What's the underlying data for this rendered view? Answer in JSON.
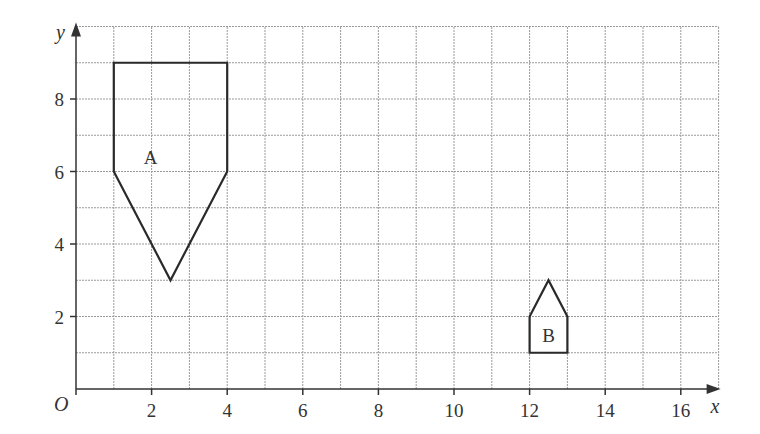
{
  "chart_data": {
    "type": "coordinate-grid",
    "xlabel": "x",
    "ylabel": "y",
    "origin_label": "O",
    "xlim": [
      0,
      17
    ],
    "ylim": [
      0,
      10
    ],
    "x_ticks": [
      2,
      4,
      6,
      8,
      10,
      12,
      14,
      16
    ],
    "y_ticks": [
      2,
      4,
      6,
      8
    ],
    "grid": true,
    "shapes": [
      {
        "name": "A",
        "vertices": [
          [
            1,
            9
          ],
          [
            4,
            9
          ],
          [
            4,
            6
          ],
          [
            2.5,
            3
          ],
          [
            1,
            6
          ]
        ],
        "label_pos": [
          1.5,
          6.4
        ]
      },
      {
        "name": "B",
        "vertices": [
          [
            12,
            1
          ],
          [
            13,
            1
          ],
          [
            13,
            2
          ],
          [
            12.5,
            3
          ],
          [
            12,
            2
          ]
        ],
        "label_pos": [
          12.5,
          1.5
        ]
      }
    ]
  },
  "colors": {
    "grid": "#9a9a9a",
    "axis": "#333333",
    "shape": "#2a2a2a"
  }
}
